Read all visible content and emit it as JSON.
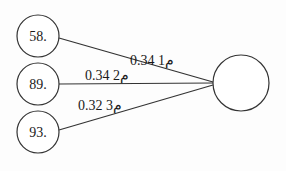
{
  "diagram": {
    "type": "path-diagram",
    "input_nodes": [
      {
        "id": "n1",
        "label": "58.",
        "cx": 38,
        "cy": 36,
        "r": 21
      },
      {
        "id": "n2",
        "label": "89.",
        "cx": 38,
        "cy": 84,
        "r": 21
      },
      {
        "id": "n3",
        "label": "93.",
        "cx": 38,
        "cy": 132,
        "r": 21
      }
    ],
    "output_node": {
      "id": "out",
      "label": "",
      "cx": 241,
      "cy": 83,
      "r": 28
    },
    "edges": [
      {
        "from": "n1",
        "to": "out",
        "label": "0.34 1م",
        "lx": 130,
        "ly": 64
      },
      {
        "from": "n2",
        "to": "out",
        "label": "0.34 2م",
        "lx": 85,
        "ly": 80
      },
      {
        "from": "n3",
        "to": "out",
        "label": "0.32 3م",
        "lx": 78,
        "ly": 110
      }
    ],
    "colors": {
      "stroke": "#333333",
      "text": "#1a1a1a"
    }
  }
}
